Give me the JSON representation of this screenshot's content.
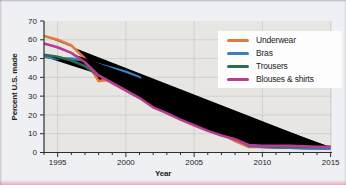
{
  "figure": {
    "background_color": "#eff0f4",
    "plot_background": "#e7e6e2",
    "grid_color": "#cfd0d5",
    "axis_color": "#2e2e2e",
    "text_color": "#242424",
    "legend_background": "#fdfdfe"
  },
  "chart_data": {
    "type": "line",
    "title": "",
    "xlabel": "Year",
    "ylabel": "Percent U.S. made",
    "xlim": [
      1994,
      2015.1
    ],
    "ylim": [
      0,
      70
    ],
    "x_ticks": [
      1995,
      2000,
      2005,
      2010,
      2015
    ],
    "y_ticks": [
      0,
      10,
      20,
      30,
      40,
      50,
      60,
      70
    ],
    "grid": true,
    "legend_position": "upper right",
    "x": [
      1994,
      1995,
      1996,
      1997,
      1998,
      1999,
      2000,
      2001,
      2002,
      2003,
      2004,
      2005,
      2006,
      2007,
      2008,
      2009,
      2010,
      2011,
      2012,
      2013,
      2014,
      2015
    ],
    "series": [
      {
        "name": "Underwear",
        "color": "#e5793c",
        "values": [
          62,
          60,
          57,
          50,
          38,
          39,
          35,
          31,
          26,
          21,
          18,
          16,
          13,
          10,
          6,
          3,
          3,
          2.5,
          2.5,
          2.5,
          2.5,
          2.5
        ]
      },
      {
        "name": "Bras",
        "color": "#3d7ec1",
        "values": [
          51,
          50,
          50,
          49,
          47,
          45,
          43,
          40,
          29,
          26,
          23,
          20,
          16.5,
          13,
          8,
          3.5,
          3,
          2.5,
          2.5,
          2.2,
          2,
          2
        ]
      },
      {
        "name": "Trousers",
        "color": "#2f6b52",
        "values": [
          52,
          51,
          49,
          46,
          41,
          38,
          34,
          30,
          25,
          22,
          18,
          15.5,
          12.5,
          9.5,
          7,
          4,
          3.5,
          3,
          3,
          3,
          3,
          3
        ]
      },
      {
        "name": "Blouses & shirts",
        "color": "#b83c8f",
        "values": [
          58,
          56,
          53,
          48,
          41,
          37,
          33,
          29,
          24,
          21,
          17.5,
          14.5,
          11.5,
          9,
          7,
          4,
          3.5,
          3.5,
          3.5,
          3.3,
          3,
          3
        ]
      }
    ]
  }
}
